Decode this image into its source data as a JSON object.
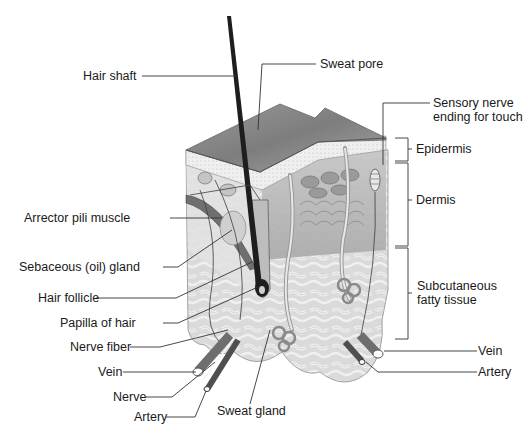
{
  "diagram": {
    "colors": {
      "background": "#ffffff",
      "label_text": "#1a1a1a",
      "leader_line": "#333333",
      "epidermis_top": "#8a8a8a",
      "dermis": "#b5b5b5",
      "subcutaneous_fat": "#d9d9d9",
      "hair": "#1e1e1e"
    },
    "left_labels": [
      {
        "id": "hair-shaft",
        "text": "Hair shaft"
      },
      {
        "id": "arrector-pili-muscle",
        "text": "Arrector pili muscle"
      },
      {
        "id": "sebaceous-gland",
        "text": "Sebaceous (oil) gland"
      },
      {
        "id": "hair-follicle",
        "text": "Hair follicle"
      },
      {
        "id": "papilla-of-hair",
        "text": "Papilla of hair"
      },
      {
        "id": "nerve-fiber",
        "text": "Nerve fiber"
      },
      {
        "id": "vein-left",
        "text": "Vein"
      },
      {
        "id": "nerve",
        "text": "Nerve"
      },
      {
        "id": "artery-left",
        "text": "Artery"
      }
    ],
    "top_labels": [
      {
        "id": "sweat-pore",
        "text": "Sweat pore"
      },
      {
        "id": "sensory-nerve-ending",
        "text_line1": "Sensory nerve",
        "text_line2": "ending for touch"
      }
    ],
    "bottom_labels": [
      {
        "id": "sweat-gland",
        "text": "Sweat gland"
      }
    ],
    "layer_brackets": [
      {
        "id": "epidermis",
        "text": "Epidermis"
      },
      {
        "id": "dermis",
        "text": "Dermis"
      },
      {
        "id": "subcutaneous",
        "text_line1": "Subcutaneous",
        "text_line2": "fatty tissue"
      }
    ],
    "right_labels": [
      {
        "id": "vein-right",
        "text": "Vein"
      },
      {
        "id": "artery-right",
        "text": "Artery"
      }
    ]
  }
}
